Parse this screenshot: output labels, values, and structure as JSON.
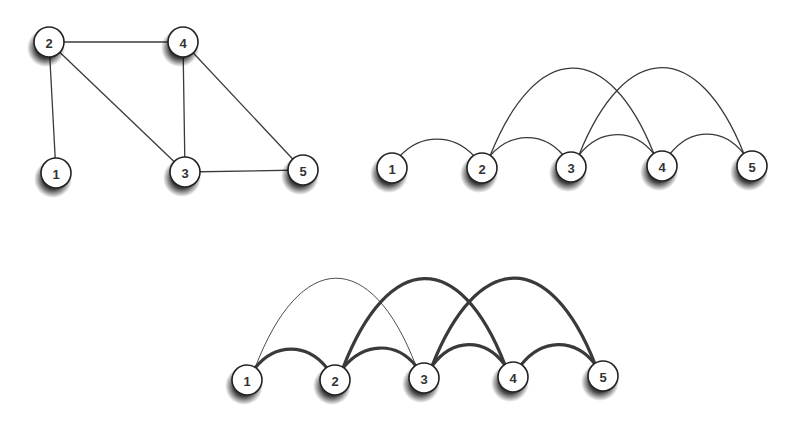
{
  "figure": {
    "node_radius": 15,
    "colors": {
      "edge": "#3a3a3a",
      "node_fill": "#ffffff",
      "node_stroke": "#222222",
      "label": "#333333"
    }
  },
  "graphs": [
    {
      "id": "original-graph",
      "kind": "planar",
      "nodes": [
        {
          "id": "1",
          "label": "1",
          "x": 56,
          "y": 173
        },
        {
          "id": "2",
          "label": "2",
          "x": 49,
          "y": 42
        },
        {
          "id": "3",
          "label": "3",
          "x": 185,
          "y": 172
        },
        {
          "id": "4",
          "label": "4",
          "x": 183,
          "y": 42
        },
        {
          "id": "5",
          "label": "5",
          "x": 303,
          "y": 170
        }
      ],
      "edges": [
        {
          "from": "2",
          "to": "4",
          "weight": 1.3
        },
        {
          "from": "2",
          "to": "1",
          "weight": 1.3
        },
        {
          "from": "2",
          "to": "3",
          "weight": 1.3
        },
        {
          "from": "4",
          "to": "3",
          "weight": 1.3
        },
        {
          "from": "4",
          "to": "5",
          "weight": 1.3
        },
        {
          "from": "3",
          "to": "5",
          "weight": 1.3
        }
      ]
    },
    {
      "id": "linear-arc-graph",
      "kind": "arc",
      "nodes": [
        {
          "id": "1",
          "label": "1",
          "x": 392,
          "y": 168
        },
        {
          "id": "2",
          "label": "2",
          "x": 482,
          "y": 168
        },
        {
          "id": "3",
          "label": "3",
          "x": 571,
          "y": 167
        },
        {
          "id": "4",
          "label": "4",
          "x": 662,
          "y": 166
        },
        {
          "id": "5",
          "label": "5",
          "x": 752,
          "y": 166
        }
      ],
      "edges": [
        {
          "from": "1",
          "to": "2",
          "peak": 139,
          "weight": 1.3
        },
        {
          "from": "2",
          "to": "3",
          "peak": 137,
          "weight": 1.3
        },
        {
          "from": "3",
          "to": "4",
          "peak": 134,
          "weight": 1.3
        },
        {
          "from": "4",
          "to": "5",
          "peak": 134,
          "weight": 1.3
        },
        {
          "from": "2",
          "to": "4",
          "peak": 67,
          "weight": 1.3
        },
        {
          "from": "3",
          "to": "5",
          "peak": 67,
          "weight": 1.3
        }
      ]
    },
    {
      "id": "weighted-arc-graph",
      "kind": "arc",
      "nodes": [
        {
          "id": "1",
          "label": "1",
          "x": 247,
          "y": 380
        },
        {
          "id": "2",
          "label": "2",
          "x": 335,
          "y": 380
        },
        {
          "id": "3",
          "label": "3",
          "x": 424,
          "y": 378
        },
        {
          "id": "4",
          "label": "4",
          "x": 513,
          "y": 377
        },
        {
          "id": "5",
          "label": "5",
          "x": 603,
          "y": 376
        }
      ],
      "edges": [
        {
          "from": "1",
          "to": "2",
          "peak": 349,
          "weight": 3.2
        },
        {
          "from": "2",
          "to": "3",
          "peak": 347,
          "weight": 3.2
        },
        {
          "from": "3",
          "to": "4",
          "peak": 344,
          "weight": 3.2
        },
        {
          "from": "4",
          "to": "5",
          "peak": 344,
          "weight": 3.2
        },
        {
          "from": "1",
          "to": "3",
          "peak": 277,
          "weight": 0.9
        },
        {
          "from": "2",
          "to": "4",
          "peak": 277,
          "weight": 3.2
        },
        {
          "from": "3",
          "to": "5",
          "peak": 277,
          "weight": 3.2
        }
      ]
    }
  ]
}
